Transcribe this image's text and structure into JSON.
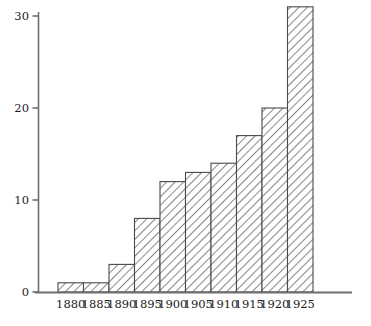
{
  "chart_data": {
    "type": "bar",
    "title": "",
    "subtitle": "",
    "xlabel": "",
    "ylabel": "",
    "categories": [
      "1880",
      "1885",
      "1890",
      "1895",
      "1900",
      "1905",
      "1910",
      "1915",
      "1920",
      "1925"
    ],
    "values": [
      1,
      1,
      3,
      8,
      12,
      13,
      14,
      17,
      20,
      31
    ],
    "series": [
      {
        "name": "count",
        "values": [
          1,
          1,
          3,
          8,
          12,
          13,
          14,
          17,
          20,
          31
        ]
      }
    ],
    "ylim": [
      0,
      31
    ],
    "xlim_labels": [
      "1880",
      "1925"
    ],
    "yticks": [
      0,
      10,
      20,
      30
    ],
    "ytick_labels": [
      "0",
      "10",
      "20",
      "30"
    ],
    "xtick_labels": [
      "1880",
      "1885",
      "1890",
      "1895",
      "1900",
      "1905",
      "1910",
      "1915",
      "1920",
      "1925"
    ],
    "grid": false,
    "legend": "none",
    "legend_entries": [],
    "annotations": [],
    "bar_fill": "hatch-diagonal",
    "bar_edge_color": "#4a4a4a",
    "bar_hatch_color": "#7a7a7a",
    "axis_color": "#6e6e6e",
    "text_color": "#1a1a1a",
    "background_color": "#ffffff"
  }
}
